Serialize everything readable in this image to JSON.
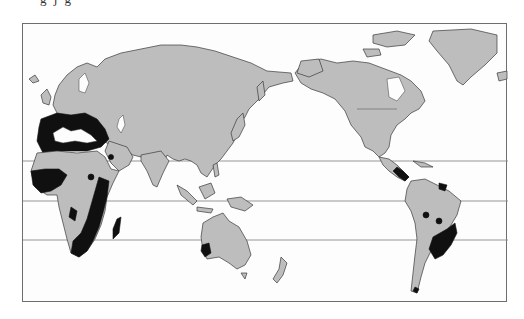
{
  "caption_fragment": "g  j  g",
  "map": {
    "projection": "Pacific-centred world map",
    "colors": {
      "land": "#bdbdbd",
      "highlighted_region": "#101010",
      "ocean": "#fdfdfd",
      "frame": "#6e6e6e",
      "latitude_lines": "#8a8a8a"
    },
    "latitude_lines": [
      {
        "name": "tropic-of-cancer",
        "y": 160
      },
      {
        "name": "equator",
        "y": 200
      },
      {
        "name": "tropic-of-capricorn",
        "y": 239
      }
    ],
    "highlighted_regions": [
      "Mediterranean coast (southern Europe and North Africa)",
      "Sahel belt of West Africa",
      "East and southern Africa",
      "Madagascar",
      "Southwest Australia",
      "Central America",
      "Northern South America (Guianas)",
      "Peru/Bolivia pockets",
      "Southeastern South America (Paraguay, southern Brazil, Uruguay, northern Argentina)"
    ]
  }
}
